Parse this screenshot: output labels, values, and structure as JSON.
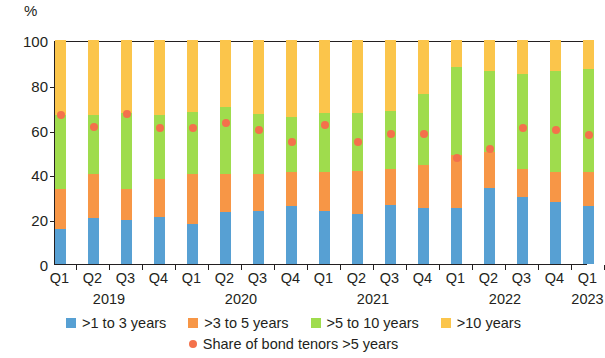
{
  "chart_data": {
    "type": "bar",
    "stacked": true,
    "title": "",
    "subtitle": "",
    "xlabel": "",
    "ylabel": "%",
    "ylim": [
      0,
      100
    ],
    "yticks": [
      0,
      20,
      40,
      60,
      80,
      100
    ],
    "grid": false,
    "legend_position": "bottom",
    "categories": [
      "Q1",
      "Q2",
      "Q3",
      "Q4",
      "Q1",
      "Q2",
      "Q3",
      "Q4",
      "Q1",
      "Q2",
      "Q3",
      "Q4",
      "Q1",
      "Q2",
      "Q3",
      "Q4",
      "Q1"
    ],
    "year_groups": [
      {
        "label": "2019",
        "start_index": 0,
        "end_index": 3
      },
      {
        "label": "2020",
        "start_index": 4,
        "end_index": 7
      },
      {
        "label": "2021",
        "start_index": 8,
        "end_index": 11
      },
      {
        "label": "2022",
        "start_index": 12,
        "end_index": 15
      },
      {
        "label": "2023",
        "start_index": 16,
        "end_index": 16
      }
    ],
    "series": [
      {
        "name": ">1 to 3 years",
        "color": "#57a0d3",
        "values": [
          15.5,
          20.5,
          19.5,
          21.0,
          18.0,
          23.0,
          23.5,
          26.0,
          23.5,
          22.5,
          26.5,
          25.0,
          25.0,
          34.0,
          30.0,
          27.5,
          26.0
        ]
      },
      {
        "name": ">3 to 5 years",
        "color": "#f79646",
        "values": [
          18.0,
          19.5,
          14.0,
          17.0,
          22.0,
          17.0,
          16.5,
          15.0,
          17.5,
          19.0,
          16.0,
          19.0,
          23.5,
          16.0,
          12.5,
          13.5,
          15.0
        ]
      },
      {
        "name": ">5 to 10 years",
        "color": "#9fdc4d",
        "values": [
          33.0,
          26.5,
          34.0,
          28.5,
          28.0,
          30.0,
          27.0,
          24.5,
          26.5,
          26.0,
          26.0,
          32.0,
          39.5,
          36.0,
          42.5,
          45.0,
          46.0
        ]
      },
      {
        "name": ">10 years",
        "color": "#fbc54b",
        "values": [
          33.5,
          33.5,
          32.5,
          33.5,
          32.0,
          30.0,
          33.0,
          34.5,
          32.5,
          32.5,
          31.5,
          24.0,
          12.0,
          14.0,
          15.0,
          14.0,
          13.0
        ]
      }
    ],
    "marker_series": {
      "name": "Share of bond tenors >5 years",
      "color": "#f4714b",
      "marker": "circle",
      "values": [
        66.5,
        61.0,
        67.0,
        60.5,
        60.5,
        63.0,
        60.0,
        54.5,
        62.0,
        54.5,
        58.0,
        58.0,
        47.5,
        51.5,
        60.5,
        60.0,
        57.5
      ]
    }
  },
  "legend": {
    "items": [
      {
        "label": ">1 to 3 years",
        "color": "#57a0d3",
        "marker": "square"
      },
      {
        "label": ">3 to 5 years",
        "color": "#f79646",
        "marker": "square"
      },
      {
        "label": ">5 to 10 years",
        "color": "#9fdc4d",
        "marker": "square"
      },
      {
        "label": ">10 years",
        "color": "#fbc54b",
        "marker": "square"
      },
      {
        "label": "Share of bond tenors >5 years",
        "color": "#f4714b",
        "marker": "circle"
      }
    ]
  },
  "axis": {
    "y_unit": "%",
    "y_tick_labels": [
      "100",
      "80",
      "60",
      "40",
      "20",
      "0"
    ]
  }
}
